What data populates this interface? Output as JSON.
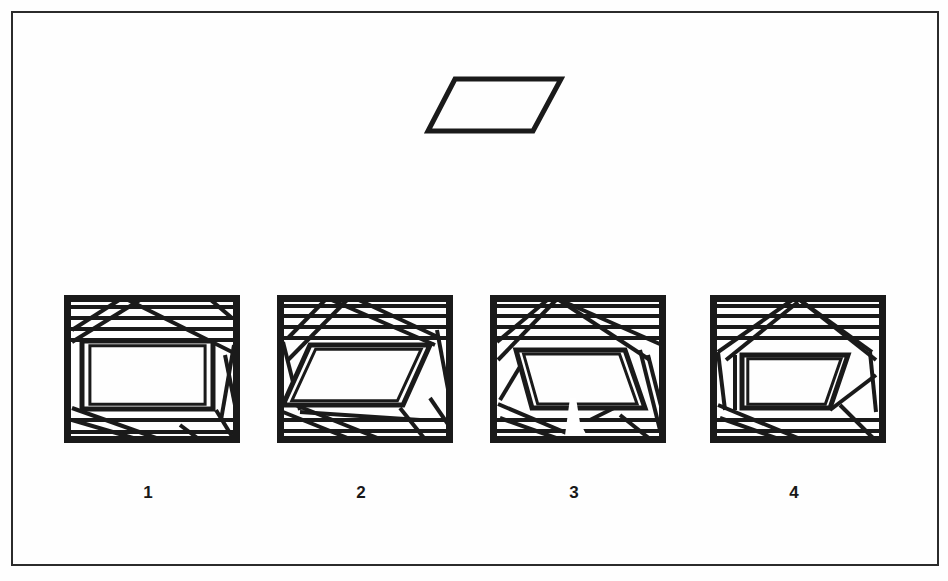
{
  "page": {
    "background_color": "#fefefe",
    "ink_color": "#1a1a1a",
    "width": 948,
    "height": 581
  },
  "border": {
    "name": "page-border",
    "x": 12,
    "y": 12,
    "width": 926,
    "height": 553,
    "stroke_width": 2,
    "color": "#2b2b2b"
  },
  "target_shape": {
    "name": "target-parallelogram",
    "type": "parallelogram",
    "stroke_width": 5,
    "color": "#1a1a1a",
    "points": [
      [
        455,
        79
      ],
      [
        561,
        79
      ],
      [
        533,
        131
      ],
      [
        428,
        131
      ]
    ]
  },
  "figures": [
    {
      "label": "1",
      "name": "figure-1",
      "box": {
        "x": 64,
        "y": 295,
        "width": 176,
        "height": 148
      },
      "frame_stroke": 7,
      "line_stroke": 4,
      "label_x": 148,
      "label_y": 483,
      "hidden_shape": "rectangle",
      "horizontal_lines_y": [
        307,
        318,
        329,
        340,
        420,
        432
      ],
      "inner_shape_points": [
        [
          82,
          341
        ],
        [
          213,
          341
        ],
        [
          213,
          409
        ],
        [
          82,
          409
        ]
      ],
      "diagonals": [
        [
          [
            72,
            330
          ],
          [
            127,
            295
          ]
        ],
        [
          [
            72,
            342
          ],
          [
            148,
            295
          ]
        ],
        [
          [
            118,
            295
          ],
          [
            232,
            352
          ]
        ],
        [
          [
            205,
            295
          ],
          [
            232,
            318
          ]
        ],
        [
          [
            234,
            345
          ],
          [
            221,
            420
          ]
        ],
        [
          [
            72,
            408
          ],
          [
            170,
            443
          ]
        ],
        [
          [
            72,
            420
          ],
          [
            150,
            443
          ]
        ],
        [
          [
            180,
            425
          ],
          [
            204,
            443
          ]
        ],
        [
          [
            216,
            410
          ],
          [
            236,
            443
          ]
        ],
        [
          [
            225,
            355
          ],
          [
            238,
            420
          ]
        ]
      ]
    },
    {
      "label": "2",
      "name": "figure-2",
      "box": {
        "x": 277,
        "y": 295,
        "width": 176,
        "height": 148
      },
      "frame_stroke": 7,
      "line_stroke": 4,
      "label_x": 361,
      "label_y": 483,
      "hidden_shape": "parallelogram",
      "horizontal_lines_y": [
        306,
        316,
        327,
        338,
        420,
        431
      ],
      "inner_shape_points": [
        [
          310,
          345
        ],
        [
          430,
          345
        ],
        [
          403,
          405
        ],
        [
          283,
          405
        ]
      ],
      "diagonals": [
        [
          [
            288,
            338
          ],
          [
            330,
            295
          ]
        ],
        [
          [
            288,
            360
          ],
          [
            352,
            295
          ]
        ],
        [
          [
            320,
            295
          ],
          [
            435,
            345
          ]
        ],
        [
          [
            348,
            295
          ],
          [
            440,
            338
          ]
        ],
        [
          [
            283,
            342
          ],
          [
            300,
            410
          ]
        ],
        [
          [
            437,
            330
          ],
          [
            450,
            400
          ]
        ],
        [
          [
            283,
            400
          ],
          [
            390,
            443
          ]
        ],
        [
          [
            283,
            412
          ],
          [
            360,
            443
          ]
        ],
        [
          [
            400,
            408
          ],
          [
            428,
            443
          ]
        ],
        [
          [
            430,
            398
          ],
          [
            452,
            430
          ]
        ],
        [
          [
            300,
            412
          ],
          [
            420,
            420
          ]
        ]
      ]
    },
    {
      "label": "3",
      "name": "figure-3",
      "box": {
        "x": 490,
        "y": 295,
        "width": 176,
        "height": 148
      },
      "frame_stroke": 7,
      "line_stroke": 4,
      "label_x": 574,
      "label_y": 483,
      "hidden_shape": "trapezoid",
      "horizontal_lines_y": [
        306,
        316,
        327,
        338,
        420,
        431
      ],
      "inner_shape_points": [
        [
          516,
          350
        ],
        [
          625,
          350
        ],
        [
          645,
          408
        ],
        [
          532,
          408
        ]
      ],
      "diagonals": [
        [
          [
            497,
            342
          ],
          [
            552,
            296
          ]
        ],
        [
          [
            498,
            360
          ],
          [
            556,
            300
          ]
        ],
        [
          [
            556,
            298
          ],
          [
            650,
            360
          ]
        ],
        [
          [
            560,
            300
          ],
          [
            662,
            345
          ]
        ],
        [
          [
            500,
            400
          ],
          [
            530,
            350
          ]
        ],
        [
          [
            648,
            355
          ],
          [
            662,
            410
          ]
        ],
        [
          [
            498,
            404
          ],
          [
            590,
            443
          ]
        ],
        [
          [
            500,
            418
          ],
          [
            570,
            443
          ]
        ],
        [
          [
            620,
            415
          ],
          [
            655,
            443
          ]
        ],
        [
          [
            590,
            420
          ],
          [
            640,
            395
          ]
        ],
        [
          [
            640,
            350
          ],
          [
            660,
            430
          ]
        ]
      ],
      "damage_artifact": {
        "x": 560,
        "y": 398,
        "width": 26,
        "height": 45,
        "note": "white scratch"
      }
    },
    {
      "label": "4",
      "name": "figure-4",
      "box": {
        "x": 710,
        "y": 295,
        "width": 176,
        "height": 148
      },
      "frame_stroke": 7,
      "line_stroke": 4,
      "label_x": 794,
      "label_y": 483,
      "hidden_shape": "parallelogram",
      "horizontal_lines_y": [
        306,
        316,
        327,
        338,
        420,
        431
      ],
      "inner_shape_points": [
        [
          742,
          355
        ],
        [
          848,
          355
        ],
        [
          830,
          408
        ],
        [
          742,
          408
        ]
      ],
      "diagonals": [
        [
          [
            718,
            352
          ],
          [
            795,
            298
          ]
        ],
        [
          [
            726,
            360
          ],
          [
            798,
            302
          ]
        ],
        [
          [
            797,
            298
          ],
          [
            872,
            352
          ]
        ],
        [
          [
            800,
            300
          ],
          [
            876,
            360
          ]
        ],
        [
          [
            718,
            352
          ],
          [
            725,
            410
          ]
        ],
        [
          [
            870,
            352
          ],
          [
            876,
            412
          ]
        ],
        [
          [
            718,
            405
          ],
          [
            810,
            443
          ]
        ],
        [
          [
            720,
            418
          ],
          [
            790,
            443
          ]
        ],
        [
          [
            840,
            405
          ],
          [
            878,
            443
          ]
        ],
        [
          [
            830,
            410
          ],
          [
            876,
            375
          ]
        ],
        [
          [
            735,
            355
          ],
          [
            735,
            410
          ]
        ]
      ]
    }
  ],
  "labels": {
    "figure_1": "1",
    "figure_2": "2",
    "figure_3": "3",
    "figure_4": "4"
  }
}
